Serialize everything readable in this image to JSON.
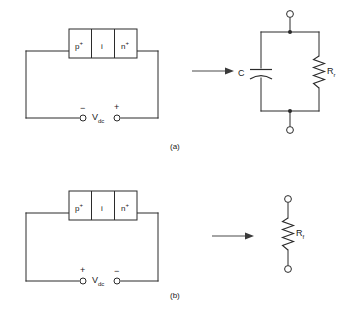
{
  "figure": {
    "line_color": "#2b2b2b",
    "background": "#ffffff",
    "arrow_color": "#3a3a3a"
  },
  "panels": [
    {
      "caption": "(a)",
      "bias": "reverse",
      "diode": {
        "regions": [
          {
            "label": "p",
            "superscript": "+"
          },
          {
            "label": "i",
            "superscript": ""
          },
          {
            "label": "n",
            "superscript": "+"
          }
        ]
      },
      "source": {
        "left_sign": "−",
        "right_sign": "+",
        "label": "V",
        "subscript": "dc"
      },
      "equivalent": {
        "type": "parallel-rc",
        "components": [
          {
            "name": "capacitor",
            "label": "C",
            "subscript": ""
          },
          {
            "name": "resistor",
            "label": "R",
            "subscript": "r"
          }
        ]
      }
    },
    {
      "caption": "(b)",
      "bias": "forward",
      "diode": {
        "regions": [
          {
            "label": "p",
            "superscript": "+"
          },
          {
            "label": "i",
            "superscript": ""
          },
          {
            "label": "n",
            "superscript": "+"
          }
        ]
      },
      "source": {
        "left_sign": "+",
        "right_sign": "−",
        "label": "V",
        "subscript": "dc"
      },
      "equivalent": {
        "type": "single-resistor",
        "components": [
          {
            "name": "resistor",
            "label": "R",
            "subscript": "f"
          }
        ]
      }
    }
  ]
}
